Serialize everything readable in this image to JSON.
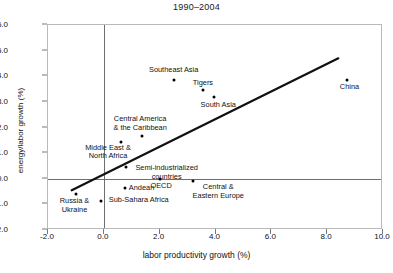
{
  "chart_data": {
    "type": "scatter",
    "title": "1990–2004",
    "xlabel": "labor productivity growth (%)",
    "ylabel": "energy/labor growth (%)",
    "xlim": [
      -2.0,
      10.0
    ],
    "ylim": [
      -2.0,
      6.0
    ],
    "xticks": [
      "-2.0",
      "0.0",
      "2.0",
      "4.0",
      "6.0",
      "8.0",
      "10.0"
    ],
    "xtick_values": [
      -2.0,
      0.0,
      2.0,
      4.0,
      6.0,
      8.0,
      10.0
    ],
    "yticks": [
      "6.0",
      "5.0",
      "4.0",
      "3.0",
      "2.0",
      "1.0",
      "0.0",
      "-1.0",
      "-2.0"
    ],
    "ytick_values": [
      6.0,
      5.0,
      4.0,
      3.0,
      2.0,
      1.0,
      0.0,
      -1.0,
      -2.0
    ],
    "grid": false,
    "legend": "none",
    "zero_lines": {
      "x": 0.0,
      "y": 0.0
    },
    "trendline": {
      "x0": -1.15,
      "y0": -0.45,
      "x1": 8.4,
      "y1": 4.7
    },
    "points": [
      {
        "label": "Southeast Asia",
        "x": 2.5,
        "y": 3.85,
        "label_x": 2.5,
        "label_dy": -14,
        "lines": [
          "Southeast Asia"
        ]
      },
      {
        "label": "Tigers",
        "x": 3.55,
        "y": 3.45,
        "label_x": 3.55,
        "label_dy": -11,
        "lines": [
          "Tigers"
        ]
      },
      {
        "label": "South Asia",
        "x": 3.95,
        "y": 3.2,
        "label_x": 4.1,
        "label_dy": 4,
        "lines": [
          "South Asia"
        ]
      },
      {
        "label": "China",
        "x": 8.7,
        "y": 3.85,
        "label_x": 8.8,
        "label_dy": 3,
        "lines": [
          "China"
        ]
      },
      {
        "label": "Central America & the Caribbean",
        "x": 1.35,
        "y": 1.65,
        "label_x": 1.3,
        "label_dy": -21,
        "lines": [
          "Central America",
          "& the Caribbean"
        ]
      },
      {
        "label": "Middle East & North Africa",
        "x": 0.6,
        "y": 1.45,
        "label_x": 0.15,
        "label_dy": 2,
        "lines": [
          "Middle East &",
          "North Africa"
        ]
      },
      {
        "label": "Semi-industrialized countries",
        "x": 0.8,
        "y": 0.45,
        "label_x": 2.25,
        "label_dy": -3,
        "lines": [
          "Semi-industrialized",
          "countries"
        ]
      },
      {
        "label": "OECD",
        "x": 2.0,
        "y": 0.0,
        "label_x": 2.05,
        "label_dy": 3,
        "lines": [
          "OECD"
        ]
      },
      {
        "label": "Andean",
        "x": 0.75,
        "y": -0.35,
        "label_x": 1.35,
        "label_dy": -4,
        "lines": [
          "Andean"
        ]
      },
      {
        "label": "Central & Eastern Europe",
        "x": 3.2,
        "y": -0.1,
        "label_x": 4.1,
        "label_dy": 2,
        "lines": [
          "Central &",
          "Eastern Europe"
        ]
      },
      {
        "label": "Russia & Ukraine",
        "x": -1.0,
        "y": -0.6,
        "label_x": -1.05,
        "label_dy": 3,
        "lines": [
          "Russia &",
          "Ukraine"
        ]
      },
      {
        "label": "Sub-Sahara Africa",
        "x": -0.1,
        "y": -0.85,
        "label_x": 1.25,
        "label_dy": -5,
        "lines": [
          "Sub-Sahara Africa"
        ]
      }
    ]
  }
}
